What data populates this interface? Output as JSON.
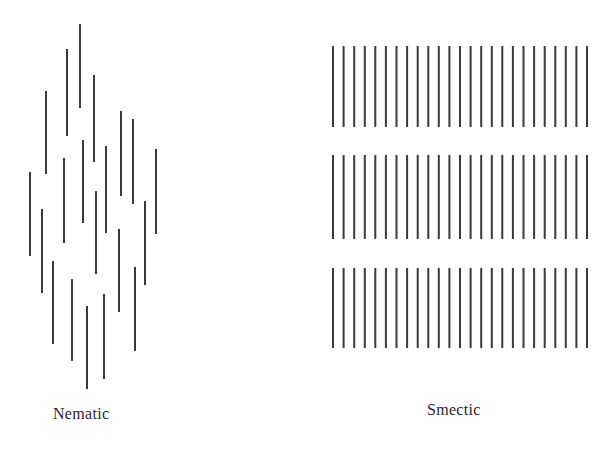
{
  "diagram": {
    "colors": {
      "line": "#3a3a3a",
      "background": "#ffffff",
      "text": "#2a2a2a"
    },
    "line_width": 2,
    "nematic": {
      "label": "Nematic",
      "description": "Rod-like molecules oriented in parallel with random (disordered) positions",
      "lines": [
        {
          "x": 80,
          "y1": 24,
          "y2": 108
        },
        {
          "x": 67,
          "y1": 49,
          "y2": 136
        },
        {
          "x": 94,
          "y1": 75,
          "y2": 162
        },
        {
          "x": 46,
          "y1": 91,
          "y2": 174
        },
        {
          "x": 121,
          "y1": 111,
          "y2": 196
        },
        {
          "x": 133,
          "y1": 119,
          "y2": 204
        },
        {
          "x": 83,
          "y1": 140,
          "y2": 223
        },
        {
          "x": 106,
          "y1": 146,
          "y2": 233
        },
        {
          "x": 156,
          "y1": 149,
          "y2": 234
        },
        {
          "x": 64,
          "y1": 158,
          "y2": 243
        },
        {
          "x": 30,
          "y1": 172,
          "y2": 256
        },
        {
          "x": 96,
          "y1": 191,
          "y2": 274
        },
        {
          "x": 145,
          "y1": 201,
          "y2": 285
        },
        {
          "x": 42,
          "y1": 209,
          "y2": 293
        },
        {
          "x": 119,
          "y1": 229,
          "y2": 312
        },
        {
          "x": 53,
          "y1": 261,
          "y2": 344
        },
        {
          "x": 135,
          "y1": 267,
          "y2": 351
        },
        {
          "x": 72,
          "y1": 279,
          "y2": 361
        },
        {
          "x": 104,
          "y1": 294,
          "y2": 379
        },
        {
          "x": 87,
          "y1": 306,
          "y2": 389
        }
      ]
    },
    "smectic": {
      "label": "Smectic",
      "description": "Rod-like molecules oriented in parallel and arranged in layers",
      "x_start": 333,
      "x_end": 587,
      "lines_per_layer": 25,
      "layers": [
        {
          "y1": 46,
          "y2": 127
        },
        {
          "y1": 155,
          "y2": 239
        },
        {
          "y1": 268,
          "y2": 348
        }
      ]
    }
  }
}
